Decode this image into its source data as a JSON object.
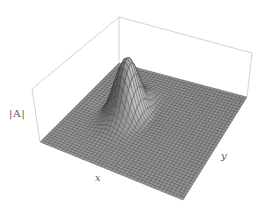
{
  "chart_data": {
    "type": "surface3d",
    "title": "",
    "xlabel": "x",
    "ylabel": "y",
    "zlabel": "|A|",
    "grid_resolution": 40,
    "surface_function": "single localized peak (gaussian-like) near center-back of the x-y domain, flat elsewhere",
    "peak": {
      "x_frac": 0.32,
      "y_frac": 0.45,
      "height_frac": 1.0,
      "width_frac": 0.07
    },
    "bounding_box": true,
    "axes_ticks": false,
    "colors": {
      "mesh_fill": "#9a9a9a",
      "mesh_line": "#3a3a3a",
      "box_line": "#c8c8c8",
      "label": "#555555"
    },
    "projection": {
      "surface_corners": {
        "back": [
          119,
          63
        ],
        "right": [
          247,
          97
        ],
        "front": [
          183,
          200
        ],
        "left": [
          40,
          142
        ]
      },
      "box_top_corners": {
        "back": [
          119,
          17
        ],
        "right": [
          252,
          53
        ],
        "left": [
          32,
          89
        ]
      },
      "peak_screen": [
        143,
        71
      ],
      "peak_pixel_height": 55
    }
  },
  "labels": {
    "z": "|A|",
    "x": "x",
    "y": "y"
  }
}
